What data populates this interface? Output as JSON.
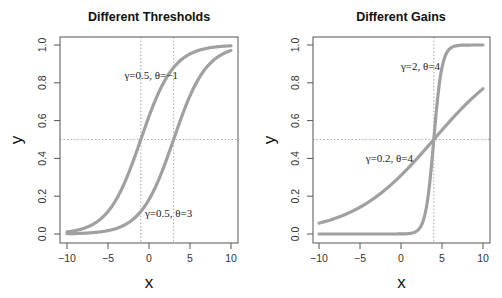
{
  "chart_data": [
    {
      "type": "line",
      "title": "Different Thresholds",
      "xlabel": "x",
      "ylabel": "y",
      "xlim": [
        -10,
        10
      ],
      "ylim": [
        0,
        1
      ],
      "xticks": [
        -10,
        -5,
        0,
        5,
        10
      ],
      "yticks": [
        0.0,
        0.2,
        0.4,
        0.6,
        0.8,
        1.0
      ],
      "xtick_labels": [
        "−10",
        "−5",
        "0",
        "5",
        "10"
      ],
      "ytick_labels": [
        "0.0",
        "0.2",
        "0.4",
        "0.6",
        "0.8",
        "1.0"
      ],
      "grid": false,
      "reference_lines": {
        "vertical": [
          -1,
          3
        ],
        "horizontal": [
          0.5
        ]
      },
      "series": [
        {
          "name": "γ=0.5, θ=−1",
          "gamma": 0.5,
          "theta": -1,
          "x": [
            -10,
            -8,
            -6,
            -4,
            -2,
            -1,
            0,
            2,
            4,
            6,
            8,
            10
          ],
          "y": [
            0.011,
            0.029,
            0.076,
            0.182,
            0.378,
            0.5,
            0.622,
            0.818,
            0.924,
            0.971,
            0.989,
            0.996
          ]
        },
        {
          "name": "γ=0.5, θ=3",
          "gamma": 0.5,
          "theta": 3,
          "x": [
            -10,
            -8,
            -6,
            -4,
            -2,
            0,
            2,
            3,
            4,
            6,
            8,
            10
          ],
          "y": [
            0.0015,
            0.004,
            0.011,
            0.029,
            0.076,
            0.182,
            0.378,
            0.5,
            0.622,
            0.818,
            0.924,
            0.971
          ]
        }
      ],
      "annotations": [
        {
          "text": "γ=0.5, θ=−1",
          "x": -1,
          "y": 0.86
        },
        {
          "text": "γ=0.5, θ=3",
          "x": 3,
          "y": 0.1
        }
      ]
    },
    {
      "type": "line",
      "title": "Different Gains",
      "xlabel": "x",
      "ylabel": "y",
      "xlim": [
        -10,
        10
      ],
      "ylim": [
        0,
        1
      ],
      "xticks": [
        -10,
        -5,
        0,
        5,
        10
      ],
      "yticks": [
        0.0,
        0.2,
        0.4,
        0.6,
        0.8,
        1.0
      ],
      "xtick_labels": [
        "−10",
        "−5",
        "0",
        "5",
        "10"
      ],
      "ytick_labels": [
        "0.0",
        "0.2",
        "0.4",
        "0.6",
        "0.8",
        "1.0"
      ],
      "grid": false,
      "reference_lines": {
        "vertical": [
          4
        ],
        "horizontal": [
          0.5
        ]
      },
      "series": [
        {
          "name": "γ=2, θ=4",
          "gamma": 2,
          "theta": 4,
          "x": [
            -10,
            0,
            2,
            3,
            3.5,
            4,
            4.5,
            5,
            6,
            8,
            10
          ],
          "y": [
            0.0,
            0.0003,
            0.018,
            0.119,
            0.269,
            0.5,
            0.731,
            0.881,
            0.982,
            1.0,
            1.0
          ]
        },
        {
          "name": "γ=0.2, θ=4",
          "gamma": 0.2,
          "theta": 4,
          "x": [
            -10,
            -8,
            -6,
            -4,
            -2,
            0,
            2,
            4,
            6,
            8,
            10
          ],
          "y": [
            0.057,
            0.083,
            0.119,
            0.168,
            0.231,
            0.31,
            0.401,
            0.5,
            0.599,
            0.69,
            0.769
          ]
        }
      ],
      "annotations": [
        {
          "text": "γ=2, θ=4",
          "x": 4,
          "y": 0.92
        },
        {
          "text": "γ=0.2, θ=4",
          "x": 2,
          "y": 0.43
        }
      ]
    }
  ],
  "style": {
    "curve_color": "#a0a0a0",
    "guide_color": "#aaaaaa",
    "axis_color": "#555555"
  }
}
